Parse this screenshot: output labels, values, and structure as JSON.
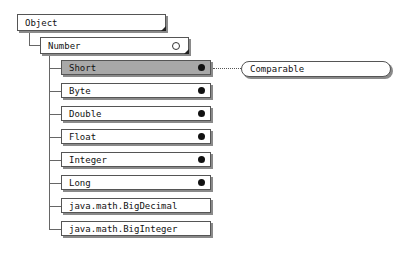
{
  "root": {
    "label": "Object"
  },
  "parent": {
    "label": "Number"
  },
  "children": [
    {
      "label": "Short",
      "marker": "filled-dot",
      "selected": true
    },
    {
      "label": "Byte",
      "marker": "filled-dot"
    },
    {
      "label": "Double",
      "marker": "filled-dot"
    },
    {
      "label": "Float",
      "marker": "filled-dot"
    },
    {
      "label": "Integer",
      "marker": "filled-dot"
    },
    {
      "label": "Long",
      "marker": "filled-dot"
    },
    {
      "label": "java.math.BigDecimal",
      "marker": "none"
    },
    {
      "label": "java.math.BigInteger",
      "marker": "none"
    }
  ],
  "interface": {
    "label": "Comparable",
    "linked_to": "Short"
  },
  "colors": {
    "selected_fill": "#a8a8a8",
    "shadow": "#8a8a8a"
  }
}
